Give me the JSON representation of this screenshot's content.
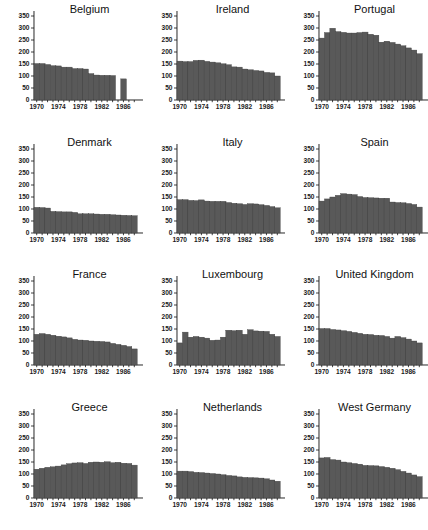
{
  "figure": {
    "title": "",
    "panel_count": 12,
    "layout": "3 columns x 4 rows small multiples"
  },
  "axes": {
    "y_ticks": [
      "0",
      "50",
      "100",
      "150",
      "200",
      "250",
      "300",
      "350"
    ],
    "x_ticks": [
      "1970",
      "1974",
      "1978",
      "1982",
      "1986"
    ],
    "ylim": [
      0,
      350
    ],
    "xlim": [
      1969.5,
      1988.5
    ],
    "grid": false
  },
  "colors": {
    "bar_fill": "#595959",
    "bar_edge": "#3a3a3a",
    "axis": "#111111",
    "background": "#ffffff",
    "text": "#111111"
  },
  "panels": [
    {
      "title": "Belgium"
    },
    {
      "title": "Ireland"
    },
    {
      "title": "Portugal"
    },
    {
      "title": "Denmark"
    },
    {
      "title": "Italy"
    },
    {
      "title": "Spain"
    },
    {
      "title": "France"
    },
    {
      "title": "Luxembourg"
    },
    {
      "title": "United Kingdom"
    },
    {
      "title": "Greece"
    },
    {
      "title": "Netherlands"
    },
    {
      "title": "West Germany"
    }
  ],
  "chart_data": {
    "type": "bar",
    "title": "",
    "subtitle": "",
    "xlabel": "",
    "ylabel": "",
    "ylim": [
      0,
      350
    ],
    "y_ticks": [
      0,
      50,
      100,
      150,
      200,
      250,
      300,
      350
    ],
    "x_ticks": [
      1970,
      1974,
      1978,
      1982,
      1986
    ],
    "x": [
      1970,
      1971,
      1972,
      1973,
      1974,
      1975,
      1976,
      1977,
      1978,
      1979,
      1980,
      1981,
      1982,
      1983,
      1984,
      1985,
      1986,
      1987,
      1988
    ],
    "legend": [],
    "legend_position": "none",
    "grid": false,
    "series": [
      {
        "name": "Belgium",
        "values": [
          152,
          152,
          148,
          143,
          142,
          137,
          137,
          131,
          131,
          129,
          110,
          104,
          103,
          103,
          102,
          null,
          88,
          null,
          null
        ]
      },
      {
        "name": "Ireland",
        "values": [
          162,
          160,
          160,
          165,
          166,
          161,
          158,
          155,
          151,
          147,
          138,
          137,
          129,
          126,
          123,
          121,
          115,
          113,
          100
        ]
      },
      {
        "name": "Portugal",
        "values": [
          258,
          281,
          299,
          285,
          282,
          279,
          279,
          281,
          283,
          274,
          270,
          241,
          245,
          240,
          233,
          226,
          217,
          208,
          193
        ]
      },
      {
        "name": "Denmark",
        "values": [
          107,
          106,
          104,
          90,
          89,
          88,
          88,
          86,
          80,
          80,
          80,
          79,
          78,
          78,
          76,
          75,
          74,
          73,
          72
        ]
      },
      {
        "name": "Italy",
        "values": [
          139,
          139,
          136,
          135,
          138,
          133,
          132,
          132,
          132,
          127,
          124,
          122,
          119,
          122,
          121,
          118,
          115,
          110,
          105
        ]
      },
      {
        "name": "Spain",
        "values": [
          133,
          142,
          150,
          157,
          164,
          162,
          160,
          152,
          148,
          147,
          146,
          145,
          145,
          129,
          127,
          126,
          123,
          119,
          108
        ]
      },
      {
        "name": "France",
        "values": [
          128,
          131,
          128,
          124,
          120,
          117,
          113,
          107,
          104,
          103,
          100,
          99,
          98,
          96,
          90,
          86,
          82,
          77,
          67
        ]
      },
      {
        "name": "Luxembourg",
        "values": [
          92,
          137,
          116,
          119,
          116,
          112,
          103,
          104,
          116,
          145,
          143,
          145,
          128,
          147,
          142,
          141,
          140,
          128,
          119
        ]
      },
      {
        "name": "United Kingdom",
        "values": [
          152,
          152,
          148,
          146,
          143,
          140,
          136,
          132,
          128,
          127,
          124,
          123,
          119,
          112,
          119,
          114,
          108,
          100,
          92
        ]
      },
      {
        "name": "Greece",
        "values": [
          120,
          124,
          128,
          130,
          133,
          138,
          143,
          146,
          147,
          144,
          149,
          150,
          149,
          151,
          147,
          149,
          145,
          144,
          137
        ]
      },
      {
        "name": "Netherlands",
        "values": [
          112,
          112,
          110,
          107,
          106,
          104,
          102,
          100,
          97,
          94,
          92,
          88,
          86,
          85,
          84,
          83,
          80,
          75,
          70
        ]
      },
      {
        "name": "West Germany",
        "values": [
          167,
          169,
          160,
          158,
          150,
          147,
          144,
          141,
          136,
          135,
          134,
          131,
          128,
          124,
          118,
          111,
          104,
          96,
          89
        ]
      }
    ]
  }
}
